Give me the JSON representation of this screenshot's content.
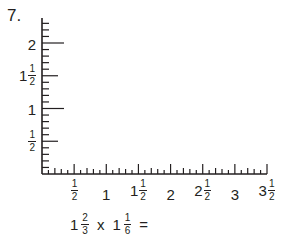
{
  "problem": {
    "number": "7.",
    "equation": {
      "a_whole": "1",
      "a_num": "2",
      "a_den": "3",
      "operator": "x",
      "b_whole": "1",
      "b_num": "1",
      "b_den": "6",
      "equals": "="
    }
  },
  "chart_data": {
    "type": "grid",
    "title": "",
    "xlabel": "",
    "ylabel": "",
    "xlim": [
      0,
      3.5
    ],
    "ylim": [
      0,
      2.2
    ],
    "grid": false,
    "minor_tick_interval": 0.1,
    "major_tick_interval": 0.5,
    "x_ticks": [
      {
        "value": 0.5,
        "whole": "",
        "num": "1",
        "den": "2"
      },
      {
        "value": 1,
        "whole": "1",
        "num": "",
        "den": ""
      },
      {
        "value": 1.5,
        "whole": "1",
        "num": "1",
        "den": "2"
      },
      {
        "value": 2,
        "whole": "2",
        "num": "",
        "den": ""
      },
      {
        "value": 2.5,
        "whole": "2",
        "num": "1",
        "den": "2"
      },
      {
        "value": 3,
        "whole": "3",
        "num": "",
        "den": ""
      },
      {
        "value": 3.5,
        "whole": "3",
        "num": "1",
        "den": "2"
      }
    ],
    "y_ticks": [
      {
        "value": 0.5,
        "whole": "",
        "num": "1",
        "den": "2"
      },
      {
        "value": 1,
        "whole": "1",
        "num": "",
        "den": ""
      },
      {
        "value": 1.5,
        "whole": "1",
        "num": "1",
        "den": "2"
      },
      {
        "value": 2,
        "whole": "2",
        "num": "",
        "den": ""
      }
    ]
  },
  "colors": {
    "ink": "#231f20",
    "background": "#ffffff"
  }
}
